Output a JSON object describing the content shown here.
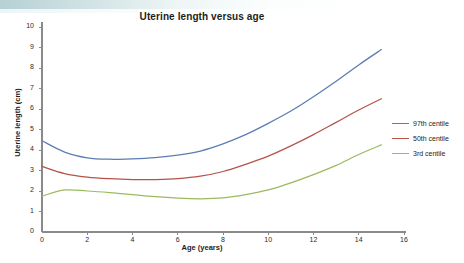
{
  "chart_data": {
    "type": "line",
    "title": "Uterine length versus age",
    "xlabel": "Age (years)",
    "ylabel": "Uterine length (cm)",
    "xlim": [
      0,
      16
    ],
    "ylim": [
      0,
      10
    ],
    "xticks": [
      0,
      2,
      4,
      6,
      8,
      10,
      12,
      14,
      16
    ],
    "yticks": [
      0,
      1,
      2,
      3,
      4,
      5,
      6,
      7,
      8,
      9,
      10
    ],
    "grid": false,
    "legend_position": "right",
    "x": [
      0,
      1,
      2,
      3,
      4,
      5,
      6,
      7,
      8,
      9,
      10,
      11,
      12,
      13,
      14,
      15
    ],
    "series": [
      {
        "name": "97th centile",
        "color": "#5b7db1",
        "values": [
          4.45,
          3.9,
          3.62,
          3.55,
          3.57,
          3.63,
          3.75,
          3.95,
          4.3,
          4.75,
          5.3,
          5.9,
          6.6,
          7.35,
          8.15,
          8.9
        ]
      },
      {
        "name": "50th centile",
        "color": "#b5534a",
        "values": [
          3.2,
          2.85,
          2.68,
          2.6,
          2.56,
          2.56,
          2.6,
          2.72,
          2.95,
          3.3,
          3.7,
          4.2,
          4.75,
          5.35,
          5.95,
          6.5
        ]
      },
      {
        "name": "3rd centile",
        "color": "#9cba5f",
        "values": [
          1.75,
          2.05,
          2.0,
          1.92,
          1.82,
          1.72,
          1.65,
          1.62,
          1.66,
          1.82,
          2.05,
          2.4,
          2.8,
          3.25,
          3.78,
          4.25
        ]
      }
    ]
  },
  "legend": {
    "entries": [
      {
        "label": "97th centile",
        "color": "#5b7db1"
      },
      {
        "label": "50th centile",
        "color": "#b5534a"
      },
      {
        "label": "3rd centile",
        "color": "#9cba5f"
      }
    ]
  },
  "axis_colors": {
    "axis_line": "#8a8a8a"
  }
}
